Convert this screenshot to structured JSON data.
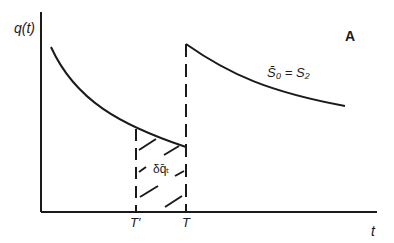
{
  "diagram": {
    "panel_label": "A",
    "y_axis_label": "q(t)",
    "x_axis_label": "t",
    "tick_labels": {
      "t_prime": "T′",
      "t": "T"
    },
    "curve_label": "S̄₀ = S₂",
    "region_label": "δq̄ₜ",
    "colors": {
      "stroke": "#1a1a1a",
      "background": "#ffffff"
    }
  }
}
